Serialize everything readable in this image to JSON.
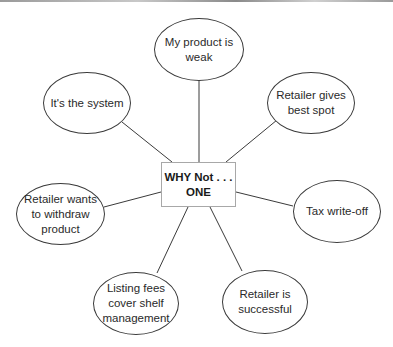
{
  "diagram": {
    "type": "spider-diagram",
    "center": {
      "lines": [
        "WHY Not . . .",
        "ONE"
      ]
    },
    "nodes": [
      {
        "id": "my-product-is-weak",
        "lines": [
          "My product is",
          "weak"
        ]
      },
      {
        "id": "retailer-gives-best-spot",
        "lines": [
          "Retailer gives",
          "best spot"
        ]
      },
      {
        "id": "tax-write-off",
        "lines": [
          "Tax write-off"
        ]
      },
      {
        "id": "retailer-is-successful",
        "lines": [
          "Retailer is",
          "successful"
        ]
      },
      {
        "id": "listing-fees-cover-shelf-management",
        "lines": [
          "Listing fees",
          "cover shelf",
          "management"
        ]
      },
      {
        "id": "retailer-wants-to-withdraw-product",
        "lines": [
          "Retailer wants",
          "to withdraw",
          "product"
        ]
      },
      {
        "id": "its-the-system",
        "lines": [
          "It's the system"
        ]
      }
    ],
    "colors": {
      "node_border": "#3a3a3a",
      "center_border": "#a8a8a8",
      "connector": "#3a3a3a",
      "text": "#222222",
      "background": "#ffffff"
    }
  }
}
